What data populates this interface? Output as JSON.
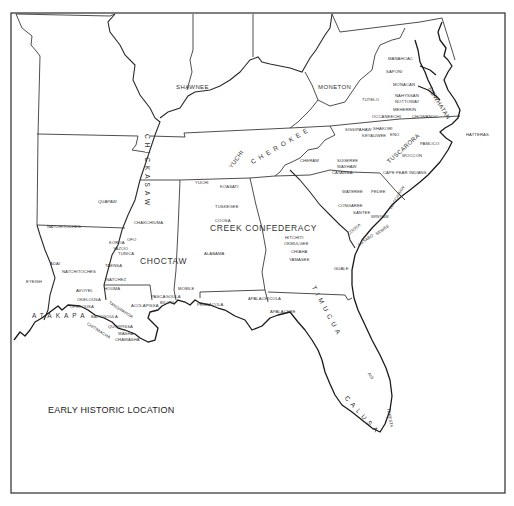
{
  "map": {
    "title": "EARLY HISTORIC LOCATION",
    "region": "Southeastern United States",
    "colors": {
      "background": "#ffffff",
      "line": "#2a2a2a",
      "text": "#333333"
    },
    "major_labels": {
      "shawnee": "SHAWNEE",
      "moneton": "MONETON",
      "powhatan": "POWHATAN",
      "chickasaw": "CHICKASAW",
      "cherokee": "CHEROKEE",
      "yuchi": "YUCHI",
      "tuscarora": "TUSCARORA",
      "creek": "CREEK CONFEDERACY",
      "choctaw": "CHOCTAW",
      "atakapa": "ATAKAPA",
      "timucua": "TIMUCUA",
      "calusa": "CALUSA"
    },
    "minor_labels": {
      "manahoac": "MANAHOAC",
      "saponi": "SAPONI",
      "monacan": "MONACAN",
      "nansemond": "NAHYSSAN",
      "nottoway": "NOTTOWAY",
      "tutelo": "TUTELO",
      "meherrin": "MEHERRIN",
      "occaneechi": "OCCANEECHI",
      "chowanoc": "CHOWANOC",
      "sissipahaw": "SISSIPAHAW",
      "shakori": "SHAKORI",
      "keyauwee": "KEYAUWEE",
      "eno": "ENO",
      "hatteras": "HATTERAS",
      "pamlico": "PAMLICO",
      "woccon": "WOCCON",
      "cheraw": "CHERAW",
      "sugeree": "SUGEREE",
      "waxhaw": "WAXHAW",
      "catawba": "CATAWBA",
      "cape_fear": "CAPE FEAR INDIANS",
      "wateree": "WATEREE",
      "pedee": "PEDEE",
      "waccamaw": "WACCAMAW",
      "congaree": "CONGAREE",
      "santee": "SANTEE",
      "winyaw": "WINYAW",
      "cusabo": "CUSABO",
      "sewee": "SEWEE",
      "cofitachiqui": "COOSA",
      "guale": "GUALE",
      "yuchi_small": "YUCHI",
      "koasati": "KOASATI",
      "tuskegee": "TUSKEGEE",
      "coosa": "COOSA",
      "hitchiti": "HITCHITI",
      "okmulgee": "OKMULGEE",
      "chiaha": "CHIAHA",
      "yamasee": "YAMASEE",
      "alabama": "ALABAMA",
      "apalachicola": "APALACHICOLA",
      "apalachee": "APALACHEE",
      "ais": "AIS",
      "tekesta": "TEKESTA",
      "quapaw": "QUAPAW",
      "chakchiuma": "CHAKCHIUMA",
      "natchitoches_n": "NATCHITOCHES",
      "koroa": "KOROA",
      "ofo": "OFO",
      "yazoo": "YAZOO",
      "tunica": "TUNICA",
      "taensa": "TAENSA",
      "adai": "ADAI",
      "natchitoches_s": "NATCHITOCHES",
      "natchez": "NATCHEZ",
      "eyeish": "EYEISH",
      "houma": "HOUMA",
      "avoyel": "AVOYEL",
      "okelousa": "OKELOUSA",
      "opelousa": "OPELOUSA",
      "bayogoula": "BAYOGOULA",
      "tangipahoa": "TANGIPAHOA",
      "acolapissa": "ACOLAPISSA",
      "pascagoula": "PASCAGOULA",
      "biloxi": "BILOXI",
      "mobile": "MOBILE",
      "pensacola": "PENSACOLA",
      "quinipissa": "QUINIPISSA",
      "washa": "WASHA",
      "chawasha": "CHAWASHA",
      "chitimacha": "CHITIMACHA"
    }
  }
}
